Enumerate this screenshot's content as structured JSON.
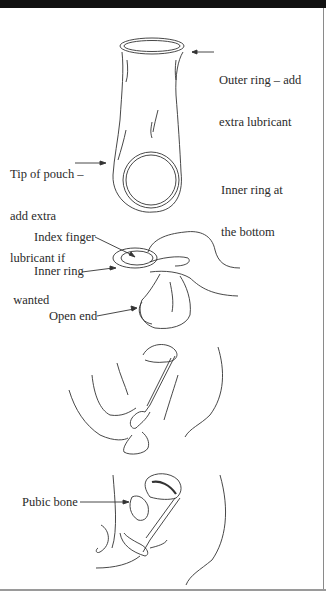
{
  "figure": {
    "panel1": {
      "outer_ring_label": [
        "Outer ring – add",
        "extra lubricant"
      ],
      "tip_label": [
        "Tip of pouch –",
        "add extra",
        "lubricant if",
        " wanted"
      ],
      "inner_ring_bottom_label": [
        "Inner ring at",
        "the bottom"
      ]
    },
    "panel2": {
      "index_finger_label": "Index finger",
      "inner_ring_label": "Inner ring",
      "open_end_label": "Open end"
    },
    "panel4": {
      "pubic_bone_label": "Pubic bone"
    }
  }
}
